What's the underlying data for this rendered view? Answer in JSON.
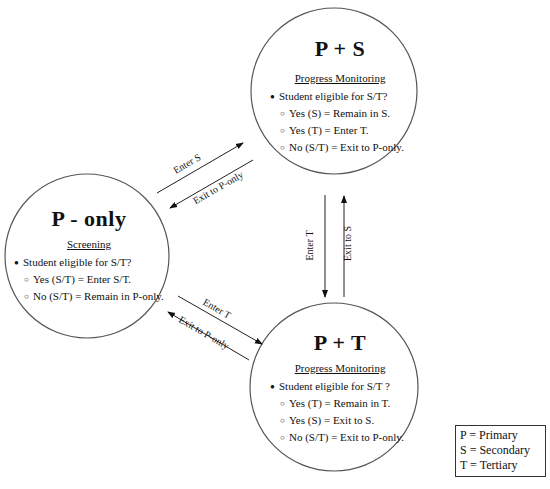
{
  "nodes": {
    "p_only": {
      "title": "P - only",
      "subtitle": "Screening",
      "question": "Student eligible for S/T?",
      "options": [
        "Yes (S/T) = Enter S/T.",
        "No (S/T) = Remain in P-only."
      ]
    },
    "p_s": {
      "title": "P + S",
      "subtitle": "Progress Monitoring",
      "question": "Student eligible for S/T?",
      "options": [
        "Yes  (S) = Remain in S.",
        "Yes (T) = Enter T.",
        "No (S/T) = Exit to P-only."
      ]
    },
    "p_t": {
      "title": "P + T",
      "subtitle": "Progress Monitoring",
      "question": "Student eligible for S/T ?",
      "options": [
        "Yes (T) = Remain in T.",
        "Yes (S) = Exit to S.",
        "No (S/T) = Exit to P-only."
      ]
    }
  },
  "edges": {
    "enter_s": "Enter S",
    "exit_s_to_p": "Exit to P-only",
    "enter_t": "Enter T",
    "exit_t_to_p": "Exit to P-only",
    "s_to_t": "Enter T",
    "t_to_s": "Exit to S"
  },
  "glyphs": {
    "bullet": "●",
    "option": "○"
  },
  "legend": [
    "P = Primary",
    "S = Secondary",
    "T = Tertiary"
  ]
}
